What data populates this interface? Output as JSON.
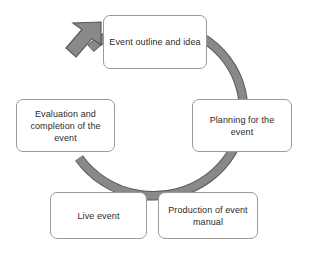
{
  "diagram": {
    "type": "cycle",
    "direction": "clockwise",
    "background_color": "#ffffff",
    "ring": {
      "name": "cycle-ring",
      "fill_color": "#808080",
      "outline_color": "#595959",
      "arrow_name": "cycle-arrowhead",
      "arrow_position": "top-left"
    },
    "nodes": [
      {
        "id": "event-outline-and-idea",
        "label": "Event outline and idea",
        "position": "top",
        "order": 1
      },
      {
        "id": "planning-for-the-event",
        "label": "Planning for the event",
        "position": "right",
        "order": 2
      },
      {
        "id": "production-of-event-manual",
        "label": "Production of event manual",
        "position": "bottom-right",
        "order": 3
      },
      {
        "id": "live-event",
        "label": "Live event",
        "position": "bottom-left",
        "order": 4
      },
      {
        "id": "evaluation-and-completion-of-the-event",
        "label": "Evaluation and completion of the event",
        "position": "left",
        "order": 5
      }
    ]
  }
}
